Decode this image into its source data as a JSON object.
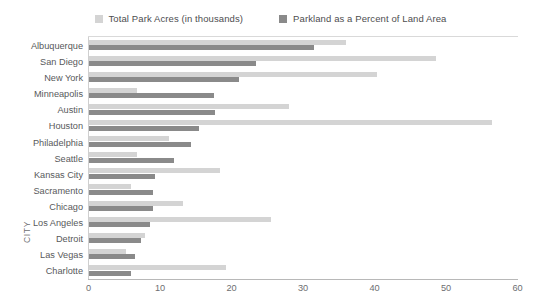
{
  "chart_data": {
    "type": "bar",
    "orientation": "horizontal",
    "title": "",
    "subtitle": "",
    "xlabel": "",
    "ylabel": "CITY",
    "xlim": [
      0,
      60
    ],
    "xticks": [
      0,
      10,
      20,
      30,
      40,
      50,
      60
    ],
    "grid": false,
    "legend_position": "top-center",
    "categories": [
      "Albuquerque",
      "San Diego",
      "New York",
      "Minneapolis",
      "Austin",
      "Houston",
      "Philadelphia",
      "Seattle",
      "Kansas City",
      "Sacramento",
      "Chicago",
      "Los Angeles",
      "Detroit",
      "Las Vegas",
      "Charlotte"
    ],
    "series": [
      {
        "name": "Total Park Acres (in thousands)",
        "color": "#d4d4d4",
        "values": [
          36.0,
          48.5,
          40.3,
          6.7,
          28.0,
          56.3,
          11.2,
          6.7,
          18.3,
          5.9,
          13.1,
          25.4,
          7.8,
          5.2,
          19.1
        ]
      },
      {
        "name": "Parkland as a Percent of Land Area",
        "color": "#8a8a8a",
        "values": [
          31.4,
          23.3,
          21.0,
          17.5,
          17.6,
          15.4,
          14.2,
          11.9,
          9.3,
          8.9,
          8.9,
          8.6,
          7.3,
          6.4,
          5.9
        ]
      }
    ]
  },
  "legend": {
    "items": [
      {
        "label": "Total Park Acres (in thousands)",
        "color": "#d4d4d4"
      },
      {
        "label": "Parkland as a Percent of Land Area",
        "color": "#8a8a8a"
      }
    ]
  },
  "axes": {
    "y_title": "CITY",
    "x_ticks": [
      "0",
      "10",
      "20",
      "30",
      "40",
      "50",
      "60"
    ]
  }
}
